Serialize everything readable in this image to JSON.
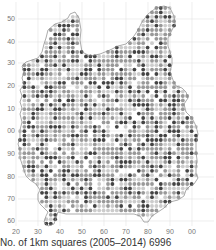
{
  "map": {
    "title": "Distribution map",
    "caption": "No. of 1km squares (2005–2014) 6996",
    "y_ticks": [
      {
        "label": "50",
        "y": 19
      },
      {
        "label": "40",
        "y": 42
      },
      {
        "label": "30",
        "y": 63
      },
      {
        "label": "20",
        "y": 86
      },
      {
        "label": "10",
        "y": 109
      },
      {
        "label": "00",
        "y": 131
      },
      {
        "label": "90",
        "y": 154
      },
      {
        "label": "80",
        "y": 177
      },
      {
        "label": "70",
        "y": 199
      },
      {
        "label": "60",
        "y": 221
      }
    ],
    "x_ticks": [
      {
        "label": "20",
        "x": 16
      },
      {
        "label": "30",
        "x": 38
      },
      {
        "label": "40",
        "x": 60
      },
      {
        "label": "50",
        "x": 82
      },
      {
        "label": "60",
        "x": 104
      },
      {
        "label": "70",
        "x": 126
      },
      {
        "label": "80",
        "x": 148
      },
      {
        "label": "90",
        "x": 170
      },
      {
        "label": "00",
        "x": 192
      }
    ],
    "colors": {
      "grid": "#e2e2e2",
      "outline": "#888888",
      "dot_dark": "#444444",
      "dot_mid": "#999999",
      "dot_light": "#cccccc",
      "label": "#777777"
    },
    "dot_spacing": 4.4,
    "dot_radius": 1.9
  }
}
